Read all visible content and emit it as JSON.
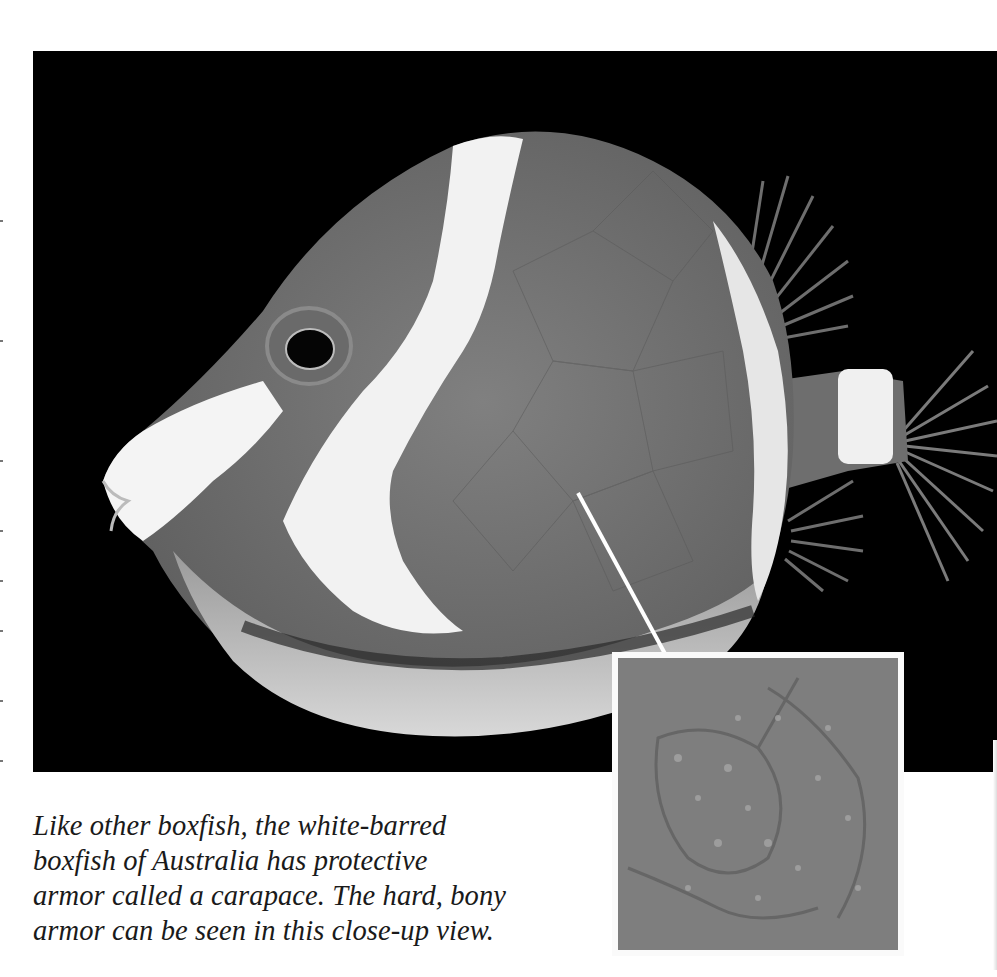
{
  "page": {
    "type": "scanned book page",
    "background_color": "#ffffff"
  },
  "photo": {
    "subject": "white-barred boxfish",
    "description": "Side view of a boxfish with white bars on a black background",
    "background_color": "#000000",
    "body_color": "#7a7a7a",
    "bar_color": "#f2f2f2"
  },
  "callout": {
    "arrow_color": "#ffffff",
    "icon": "arrow-down-right-icon"
  },
  "inset": {
    "description": "Close-up view of the bony carapace texture",
    "border_color": "#fafafa",
    "fill_color": "#7d7d7d"
  },
  "caption": {
    "lines": [
      "Like other boxfish, the white-barred",
      "boxfish of Australia has protective",
      "armor called a carapace. The hard, bony",
      "armor can be seen in this close-up view."
    ],
    "text_color": "#1a1a1a"
  }
}
